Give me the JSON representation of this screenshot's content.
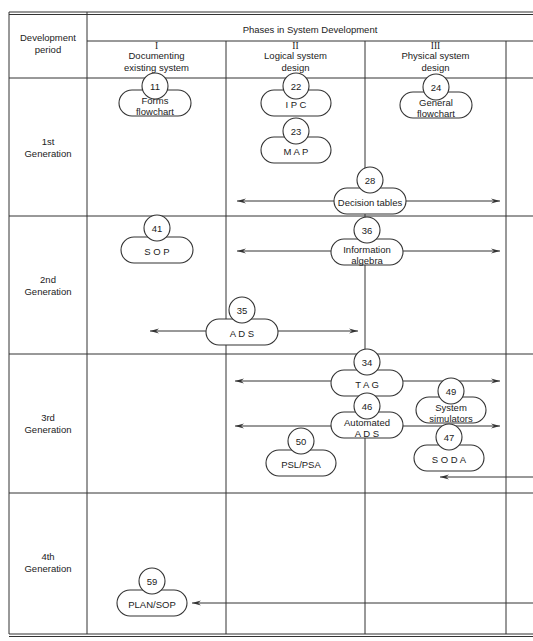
{
  "header": {
    "period_label": "Development\nperiod",
    "phases_title": "Phases in System Development",
    "phases": [
      {
        "numeral": "I",
        "label": "Documenting\nexisting system"
      },
      {
        "numeral": "II",
        "label": "Logical system\ndesign"
      },
      {
        "numeral": "III",
        "label": "Physical system\ndesign"
      }
    ]
  },
  "rows": [
    {
      "label": "1st\nGeneration"
    },
    {
      "label": "2nd\nGeneration"
    },
    {
      "label": "3rd\nGeneration"
    },
    {
      "label": "4th\nGeneration"
    }
  ],
  "nodes": [
    {
      "num": "11",
      "label": "Forms\nflowchart",
      "cx": 155,
      "cy": 103,
      "w": 72,
      "spaced": false,
      "circle_y": 86
    },
    {
      "num": "22",
      "label": "I P C",
      "cx": 296,
      "cy": 103,
      "w": 70,
      "spaced": false,
      "circle_y": 86
    },
    {
      "num": "23",
      "label": "M A P",
      "cx": 296,
      "cy": 150,
      "w": 70,
      "spaced": false,
      "circle_y": 131
    },
    {
      "num": "24",
      "label": "General\nflowchart",
      "cx": 436,
      "cy": 105,
      "w": 72,
      "spaced": false,
      "circle_y": 87
    },
    {
      "num": "28",
      "label": "Decision tables",
      "cx": 370,
      "cy": 201,
      "w": 72,
      "spaced": false,
      "circle_y": 180
    },
    {
      "num": "41",
      "label": "S O P",
      "cx": 157,
      "cy": 250,
      "w": 72,
      "spaced": false,
      "circle_y": 228
    },
    {
      "num": "36",
      "label": "Information\nalgebra",
      "cx": 367,
      "cy": 252,
      "w": 72,
      "spaced": false,
      "circle_y": 230
    },
    {
      "num": "35",
      "label": "A D S",
      "cx": 242,
      "cy": 332,
      "w": 72,
      "spaced": false,
      "circle_y": 310
    },
    {
      "num": "34",
      "label": "T A G",
      "cx": 367,
      "cy": 383,
      "w": 72,
      "spaced": false,
      "circle_y": 362
    },
    {
      "num": "49",
      "label": "System\nsimulators",
      "cx": 451,
      "cy": 410,
      "w": 70,
      "spaced": false,
      "circle_y": 391
    },
    {
      "num": "46",
      "label": "Automated\nA D S",
      "cx": 367,
      "cy": 425,
      "w": 72,
      "spaced": false,
      "circle_y": 406
    },
    {
      "num": "50",
      "label": "PSL/PSA",
      "cx": 301,
      "cy": 463,
      "w": 70,
      "spaced": false,
      "circle_y": 441
    },
    {
      "num": "47",
      "label": "S O D A",
      "cx": 449,
      "cy": 458,
      "w": 70,
      "spaced": false,
      "circle_y": 437
    },
    {
      "num": "59",
      "label": "PLAN/SOP",
      "cx": 152,
      "cy": 603,
      "w": 70,
      "spaced": false,
      "circle_y": 581
    }
  ],
  "arrows": [
    {
      "name": "decision-tables-arrow",
      "y": 201,
      "x1": 237,
      "x2": 500,
      "left_head": true,
      "right_head": true
    },
    {
      "name": "information-algebra-arrow",
      "y": 251,
      "x1": 237,
      "x2": 500,
      "left_head": true,
      "right_head": true
    },
    {
      "name": "ads-arrow",
      "y": 331,
      "x1": 150,
      "x2": 358,
      "left_head": true,
      "right_head": true
    },
    {
      "name": "tag-arrow",
      "y": 381,
      "x1": 235,
      "x2": 500,
      "left_head": true,
      "right_head": true
    },
    {
      "name": "automated-ads-arrow",
      "y": 426,
      "x1": 235,
      "x2": 500,
      "left_head": true,
      "right_head": true
    },
    {
      "name": "soda-arrow",
      "y": 477,
      "x1": 440,
      "x2": 533,
      "left_head": true,
      "right_head": false
    },
    {
      "name": "plan-sop-arrow",
      "y": 603,
      "x1": 192,
      "x2": 533,
      "left_head": true,
      "right_head": false
    }
  ]
}
